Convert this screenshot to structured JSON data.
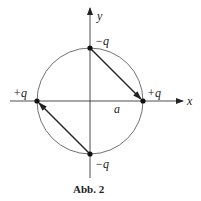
{
  "figure": {
    "caption": "Abb. 2",
    "axes": {
      "x_label": "x",
      "y_label": "y"
    },
    "radius_label": "a",
    "charges": [
      {
        "position": "top",
        "label": "−q"
      },
      {
        "position": "right",
        "label": "+q"
      },
      {
        "position": "bottom",
        "label": "−q"
      },
      {
        "position": "left",
        "label": "+q"
      }
    ],
    "arrows": [
      {
        "from": "top",
        "to": "right"
      },
      {
        "from": "bottom",
        "to": "left"
      }
    ],
    "colors": {
      "stroke": "#222222",
      "background": "#ffffff"
    }
  }
}
